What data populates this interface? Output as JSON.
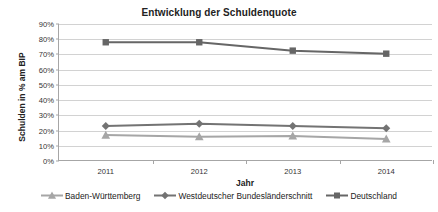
{
  "chart_data": {
    "type": "line",
    "title": "Entwicklung der Schuldenquote",
    "xlabel": "Jahr",
    "ylabel": "Schulden in % am BIP",
    "categories": [
      "2011",
      "2012",
      "2013",
      "2014"
    ],
    "x": [
      2011,
      2012,
      2013,
      2014
    ],
    "ylim": [
      0,
      90
    ],
    "ytick_labels": [
      "0%",
      "10%",
      "20%",
      "30%",
      "40%",
      "50%",
      "60%",
      "70%",
      "80%",
      "90%"
    ],
    "ytick_values": [
      0,
      10,
      20,
      30,
      40,
      50,
      60,
      70,
      80,
      90
    ],
    "grid": true,
    "legend_position": "bottom",
    "series": [
      {
        "name": "Baden-Württemberg",
        "values": [
          17,
          16,
          16.5,
          14.5
        ],
        "color": "#a6a6a6",
        "marker": "triangle"
      },
      {
        "name": "Westdeutscher Bundesländerschnitt",
        "values": [
          23,
          24.5,
          23,
          21.5
        ],
        "color": "#737373",
        "marker": "diamond"
      },
      {
        "name": "Deutschland",
        "values": [
          78,
          78,
          72.5,
          70.5
        ],
        "color": "#666666",
        "marker": "square"
      }
    ]
  },
  "colors": {
    "grid": "#d2d2d2",
    "axis": "#a6a6a6",
    "text": "#222222",
    "background": "#ffffff"
  }
}
